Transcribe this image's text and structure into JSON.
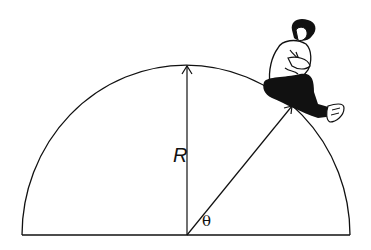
{
  "diagram": {
    "type": "physics-hemisphere",
    "labels": {
      "radius": "R",
      "angle": "θ"
    },
    "colors": {
      "stroke": "#111111",
      "background": "#ffffff"
    }
  }
}
